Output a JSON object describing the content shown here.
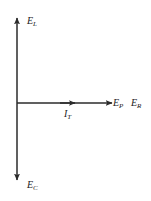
{
  "diagram": {
    "type": "phasor-diagram",
    "background_color": "#ffffff",
    "stroke_color": "#2b2b2b",
    "text_color": "#1a1a1a",
    "axes": {
      "vertical_up": {
        "icon": "arrow-up-icon",
        "label_base": "E",
        "label_sub": "L",
        "meaning": "inductive-voltage"
      },
      "vertical_down": {
        "icon": "arrow-down-icon",
        "label_base": "E",
        "label_sub": "C",
        "meaning": "capacitive-voltage"
      },
      "horizontal_right": {
        "icon": "arrow-right-icon",
        "label_base": "E",
        "label_sub": "P",
        "meaning": "applied-voltage"
      },
      "horizontal_right_second": {
        "icon": "arrow-right-icon",
        "label_base": "E",
        "label_sub": "R",
        "meaning": "resistive-voltage"
      },
      "current_vector": {
        "icon": "arrow-right-icon",
        "label_base": "I",
        "label_sub": "T",
        "meaning": "total-current"
      }
    },
    "geometry": {
      "origin_x": 17,
      "origin_y": 103,
      "vertical_top_y": 18,
      "vertical_bottom_y": 180,
      "horizontal_end_x": 112,
      "mid_arrow_x": 75
    }
  }
}
